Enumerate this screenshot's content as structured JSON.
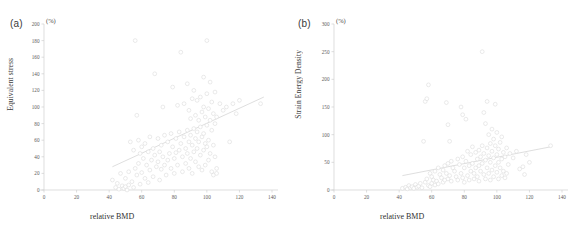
{
  "figure": {
    "background": "#ffffff",
    "marker_stroke": "#d9d9d9",
    "marker_fill": "#ffffff",
    "axis_color": "#d0d0d0",
    "trend_color": "#d5d5d5"
  },
  "panels": [
    {
      "label": "(a)",
      "unit": "(%)",
      "ylabel": "Equivalent stress",
      "xlabel": "relative BMD"
    },
    {
      "label": "(b)",
      "unit": "(%)",
      "ylabel": "Strain Energy Density",
      "xlabel": "relative BMD"
    }
  ],
  "chart_data": [
    {
      "type": "scatter",
      "title": "(a)",
      "xlabel": "relative BMD",
      "ylabel": "Equivalent stress",
      "yunit": "(%)",
      "xlim": [
        0,
        140
      ],
      "ylim": [
        0,
        200
      ],
      "xticks": [
        0,
        20,
        40,
        60,
        80,
        100,
        120,
        140
      ],
      "yticks": [
        0,
        20,
        40,
        60,
        80,
        100,
        120,
        140,
        160,
        180,
        200
      ],
      "grid": false,
      "legend": "none",
      "trendline": {
        "x": [
          42,
          135
        ],
        "y": [
          28,
          112
        ]
      },
      "points": [
        [
          42,
          12
        ],
        [
          44,
          3
        ],
        [
          45,
          8
        ],
        [
          46,
          1
        ],
        [
          47,
          20
        ],
        [
          48,
          5
        ],
        [
          49,
          2
        ],
        [
          50,
          14
        ],
        [
          50,
          4
        ],
        [
          51,
          0
        ],
        [
          52,
          22
        ],
        [
          52,
          6
        ],
        [
          53,
          58
        ],
        [
          54,
          10
        ],
        [
          55,
          48
        ],
        [
          55,
          3
        ],
        [
          56,
          180
        ],
        [
          56,
          26
        ],
        [
          57,
          90
        ],
        [
          57,
          18
        ],
        [
          58,
          60
        ],
        [
          58,
          32
        ],
        [
          59,
          44
        ],
        [
          59,
          7
        ],
        [
          60,
          52
        ],
        [
          60,
          21
        ],
        [
          61,
          38
        ],
        [
          62,
          56
        ],
        [
          62,
          14
        ],
        [
          63,
          30
        ],
        [
          64,
          46
        ],
        [
          64,
          9
        ],
        [
          65,
          64
        ],
        [
          65,
          24
        ],
        [
          66,
          36
        ],
        [
          67,
          50
        ],
        [
          67,
          16
        ],
        [
          68,
          140
        ],
        [
          68,
          42
        ],
        [
          69,
          28
        ],
        [
          70,
          62
        ],
        [
          70,
          34
        ],
        [
          71,
          46
        ],
        [
          71,
          12
        ],
        [
          72,
          54
        ],
        [
          72,
          25
        ],
        [
          73,
          100
        ],
        [
          73,
          40
        ],
        [
          74,
          66
        ],
        [
          74,
          30
        ],
        [
          75,
          18
        ],
        [
          76,
          58
        ],
        [
          76,
          36
        ],
        [
          77,
          44
        ],
        [
          78,
          68
        ],
        [
          78,
          26
        ],
        [
          79,
          124
        ],
        [
          79,
          52
        ],
        [
          80,
          38
        ],
        [
          80,
          20
        ],
        [
          81,
          62
        ],
        [
          81,
          45
        ],
        [
          82,
          102
        ],
        [
          82,
          30
        ],
        [
          83,
          70
        ],
        [
          83,
          48
        ],
        [
          84,
          166
        ],
        [
          84,
          56
        ],
        [
          85,
          40
        ],
        [
          85,
          22
        ],
        [
          86,
          104
        ],
        [
          86,
          64
        ],
        [
          87,
          50
        ],
        [
          87,
          32
        ],
        [
          88,
          128
        ],
        [
          88,
          72
        ],
        [
          88,
          44
        ],
        [
          89,
          96
        ],
        [
          89,
          58
        ],
        [
          89,
          26
        ],
        [
          90,
          86
        ],
        [
          90,
          66
        ],
        [
          90,
          38
        ],
        [
          91,
          110
        ],
        [
          91,
          54
        ],
        [
          91,
          20
        ],
        [
          92,
          120
        ],
        [
          92,
          74
        ],
        [
          92,
          46
        ],
        [
          93,
          90
        ],
        [
          93,
          62
        ],
        [
          93,
          34
        ],
        [
          94,
          108
        ],
        [
          94,
          70
        ],
        [
          94,
          50
        ],
        [
          95,
          84
        ],
        [
          95,
          58
        ],
        [
          95,
          28
        ],
        [
          96,
          112
        ],
        [
          96,
          76
        ],
        [
          96,
          42
        ],
        [
          97,
          94
        ],
        [
          97,
          64
        ],
        [
          97,
          24
        ],
        [
          98,
          136
        ],
        [
          98,
          100
        ],
        [
          98,
          68
        ],
        [
          98,
          48
        ],
        [
          99,
          88
        ],
        [
          99,
          56
        ],
        [
          99,
          30
        ],
        [
          100,
          180
        ],
        [
          100,
          116
        ],
        [
          100,
          78
        ],
        [
          100,
          52
        ],
        [
          101,
          98
        ],
        [
          101,
          60
        ],
        [
          101,
          36
        ],
        [
          102,
          130
        ],
        [
          102,
          84
        ],
        [
          102,
          44
        ],
        [
          103,
          106
        ],
        [
          103,
          72
        ],
        [
          103,
          22
        ],
        [
          104,
          92
        ],
        [
          104,
          54
        ],
        [
          104,
          18
        ],
        [
          105,
          118
        ],
        [
          105,
          80
        ],
        [
          105,
          40
        ],
        [
          106,
          88
        ],
        [
          106,
          26
        ],
        [
          106,
          20
        ],
        [
          108,
          104
        ],
        [
          110,
          96
        ],
        [
          112,
          100
        ],
        [
          114,
          58
        ],
        [
          116,
          104
        ],
        [
          118,
          92
        ],
        [
          120,
          108
        ],
        [
          133,
          104
        ]
      ]
    },
    {
      "type": "scatter",
      "title": "(b)",
      "xlabel": "relative BMD",
      "ylabel": "Strain Energy Density",
      "yunit": "(%)",
      "xlim": [
        0,
        140
      ],
      "ylim": [
        0,
        300
      ],
      "xticks": [
        0,
        20,
        40,
        60,
        80,
        100,
        120,
        140
      ],
      "yticks": [
        0,
        50,
        100,
        150,
        200,
        250,
        300
      ],
      "grid": false,
      "legend": "none",
      "trendline": {
        "x": [
          42,
          133
        ],
        "y": [
          26,
          78
        ]
      },
      "points": [
        [
          42,
          3
        ],
        [
          44,
          5
        ],
        [
          45,
          2
        ],
        [
          46,
          8
        ],
        [
          47,
          4
        ],
        [
          48,
          6
        ],
        [
          49,
          3
        ],
        [
          50,
          10
        ],
        [
          51,
          5
        ],
        [
          52,
          7
        ],
        [
          53,
          12
        ],
        [
          54,
          4
        ],
        [
          55,
          88
        ],
        [
          56,
          160
        ],
        [
          56,
          14
        ],
        [
          57,
          165
        ],
        [
          57,
          20
        ],
        [
          58,
          190
        ],
        [
          58,
          8
        ],
        [
          59,
          30
        ],
        [
          59,
          6
        ],
        [
          60,
          24
        ],
        [
          60,
          12
        ],
        [
          61,
          18
        ],
        [
          62,
          34
        ],
        [
          62,
          9
        ],
        [
          63,
          16
        ],
        [
          64,
          40
        ],
        [
          64,
          11
        ],
        [
          65,
          28
        ],
        [
          66,
          22
        ],
        [
          67,
          36
        ],
        [
          67,
          14
        ],
        [
          68,
          44
        ],
        [
          68,
          18
        ],
        [
          69,
          158
        ],
        [
          69,
          30
        ],
        [
          70,
          118
        ],
        [
          70,
          48
        ],
        [
          70,
          20
        ],
        [
          71,
          88
        ],
        [
          71,
          26
        ],
        [
          72,
          52
        ],
        [
          72,
          16
        ],
        [
          73,
          40
        ],
        [
          74,
          34
        ],
        [
          75,
          24
        ],
        [
          76,
          56
        ],
        [
          76,
          18
        ],
        [
          77,
          46
        ],
        [
          78,
          150
        ],
        [
          78,
          30
        ],
        [
          79,
          136
        ],
        [
          79,
          60
        ],
        [
          79,
          22
        ],
        [
          80,
          40
        ],
        [
          80,
          14
        ],
        [
          81,
          128
        ],
        [
          81,
          52
        ],
        [
          82,
          70
        ],
        [
          82,
          26
        ],
        [
          83,
          44
        ],
        [
          83,
          18
        ],
        [
          84,
          64
        ],
        [
          84,
          34
        ],
        [
          85,
          78
        ],
        [
          85,
          48
        ],
        [
          86,
          30
        ],
        [
          86,
          20
        ],
        [
          87,
          68
        ],
        [
          87,
          40
        ],
        [
          88,
          56
        ],
        [
          88,
          24
        ],
        [
          89,
          72
        ],
        [
          89,
          44
        ],
        [
          89,
          16
        ],
        [
          90,
          60
        ],
        [
          90,
          34
        ],
        [
          91,
          250
        ],
        [
          91,
          80
        ],
        [
          91,
          48
        ],
        [
          92,
          140
        ],
        [
          92,
          66
        ],
        [
          92,
          28
        ],
        [
          93,
          120
        ],
        [
          93,
          54
        ],
        [
          93,
          20
        ],
        [
          94,
          160
        ],
        [
          94,
          76
        ],
        [
          94,
          40
        ],
        [
          95,
          100
        ],
        [
          95,
          62
        ],
        [
          95,
          30
        ],
        [
          96,
          84
        ],
        [
          96,
          50
        ],
        [
          96,
          18
        ],
        [
          97,
          110
        ],
        [
          97,
          70
        ],
        [
          97,
          36
        ],
        [
          98,
          92
        ],
        [
          98,
          58
        ],
        [
          98,
          24
        ],
        [
          99,
          155
        ],
        [
          99,
          80
        ],
        [
          99,
          44
        ],
        [
          100,
          104
        ],
        [
          100,
          64
        ],
        [
          100,
          32
        ],
        [
          101,
          74
        ],
        [
          101,
          50
        ],
        [
          101,
          20
        ],
        [
          102,
          86
        ],
        [
          102,
          40
        ],
        [
          103,
          96
        ],
        [
          103,
          56
        ],
        [
          103,
          26
        ],
        [
          104,
          68
        ],
        [
          104,
          34
        ],
        [
          105,
          60
        ],
        [
          105,
          22
        ],
        [
          106,
          76
        ],
        [
          106,
          30
        ],
        [
          107,
          46
        ],
        [
          108,
          66
        ],
        [
          110,
          58
        ],
        [
          112,
          70
        ],
        [
          114,
          38
        ],
        [
          116,
          42
        ],
        [
          117,
          28
        ],
        [
          118,
          64
        ],
        [
          120,
          50
        ],
        [
          133,
          80
        ]
      ]
    }
  ]
}
